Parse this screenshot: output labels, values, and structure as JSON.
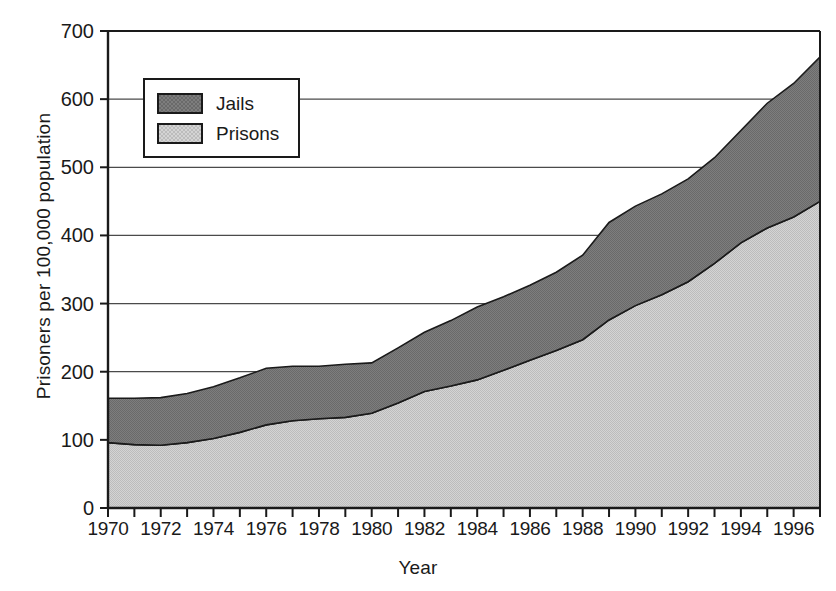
{
  "chart_data": {
    "type": "area",
    "stacked": true,
    "title": "",
    "subtitle": "",
    "xlabel": "Year",
    "ylabel": "Prisoners per 100,000 population",
    "xlim": [
      1970,
      1997
    ],
    "ylim": [
      0,
      700
    ],
    "y_ticks": [
      0,
      100,
      200,
      300,
      400,
      500,
      600,
      700
    ],
    "y_tick_labels": [
      "0",
      "100",
      "200",
      "300",
      "400",
      "500",
      "600",
      "700"
    ],
    "x_ticks": [
      1970,
      1971,
      1972,
      1973,
      1974,
      1975,
      1976,
      1977,
      1978,
      1979,
      1980,
      1981,
      1982,
      1983,
      1984,
      1985,
      1986,
      1987,
      1988,
      1989,
      1990,
      1991,
      1992,
      1993,
      1994,
      1995,
      1996,
      1997
    ],
    "x_tick_labels": [
      "1970",
      "",
      "1972",
      "",
      "1974",
      "",
      "1976",
      "",
      "1978",
      "",
      "1980",
      "",
      "1982",
      "",
      "1984",
      "",
      "1986",
      "",
      "1988",
      "",
      "1990",
      "",
      "1992",
      "",
      "1994",
      "",
      "1996",
      ""
    ],
    "x": [
      1970,
      1971,
      1972,
      1973,
      1974,
      1975,
      1976,
      1977,
      1978,
      1979,
      1980,
      1981,
      1982,
      1983,
      1984,
      1985,
      1986,
      1987,
      1988,
      1989,
      1990,
      1991,
      1992,
      1993,
      1994,
      1995,
      1996,
      1997
    ],
    "grid": "horizontal",
    "legend_position": "upper-left-inside",
    "series": [
      {
        "name": "Prisons",
        "color": "#c9c9c9",
        "values": [
          96,
          93,
          92,
          96,
          102,
          111,
          122,
          128,
          131,
          133,
          139,
          154,
          171,
          179,
          188,
          202,
          217,
          231,
          247,
          276,
          297,
          313,
          332,
          359,
          389,
          411,
          427,
          450
        ]
      },
      {
        "name": "Jails",
        "color": "#767676",
        "values": [
          65,
          68,
          70,
          72,
          76,
          80,
          83,
          80,
          77,
          78,
          74,
          81,
          87,
          96,
          107,
          108,
          110,
          115,
          124,
          143,
          146,
          148,
          151,
          155,
          165,
          183,
          196,
          212
        ]
      }
    ],
    "totals": [
      161,
      161,
      162,
      168,
      178,
      191,
      205,
      208,
      208,
      211,
      213,
      235,
      258,
      275,
      295,
      310,
      327,
      346,
      371,
      419,
      443,
      461,
      483,
      514,
      554,
      594,
      623,
      662
    ]
  },
  "legend": {
    "items": [
      {
        "label": "Jails",
        "color": "#767676"
      },
      {
        "label": "Prisons",
        "color": "#c9c9c9"
      }
    ]
  },
  "axes": {
    "x_title": "Year",
    "y_title": "Prisoners per 100,000 population"
  }
}
